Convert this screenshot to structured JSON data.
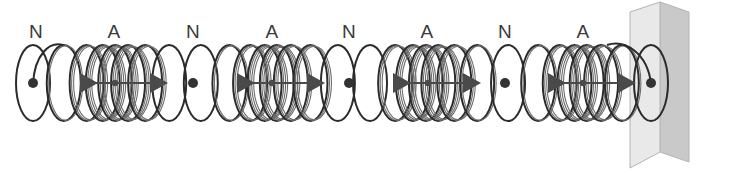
{
  "figure": {
    "background_color": "#ffffff",
    "width": 742,
    "height": 179,
    "axis_y": 83
  },
  "labels": [
    {
      "text": "N",
      "x": 36,
      "y": 38,
      "kind": "node"
    },
    {
      "text": "A",
      "x": 114,
      "y": 38,
      "kind": "antinode"
    },
    {
      "text": "N",
      "x": 193,
      "y": 38,
      "kind": "node"
    },
    {
      "text": "A",
      "x": 272,
      "y": 38,
      "kind": "antinode"
    },
    {
      "text": "N",
      "x": 349,
      "y": 38,
      "kind": "node"
    },
    {
      "text": "A",
      "x": 427,
      "y": 38,
      "kind": "antinode"
    },
    {
      "text": "N",
      "x": 505,
      "y": 38,
      "kind": "node"
    },
    {
      "text": "A",
      "x": 583,
      "y": 38,
      "kind": "antinode"
    }
  ],
  "spring": {
    "stroke_color": "#2b2b2b",
    "stroke_width": 2.0,
    "coil_count": 30,
    "start_x": 33,
    "end_x": 651,
    "coil_rx": 17,
    "coil_ry": 38,
    "bundle_color": "#6d6d6d"
  },
  "nodes": {
    "dot_color": "#333333",
    "dot_radius": 5,
    "positions": [
      33,
      193,
      349,
      505,
      651
    ]
  },
  "antinodes": {
    "arrow_color": "#4a4a4a",
    "centers": [
      115,
      272,
      428,
      583
    ],
    "half_length": 37,
    "head_length": 20,
    "head_width": 13
  },
  "wall": {
    "front_fill": "#e9e9e9",
    "side_fill": "#c9c9c9",
    "edge_color": "#b4b4b4",
    "front_points": "630,12 660,2 660,152 630,168",
    "side_points": "660,2 689,12 689,162 660,152",
    "label": "wall"
  },
  "chart_data": {
    "type": "line",
    "xlabel": "",
    "ylabel": "",
    "annotations": [
      "N",
      "A",
      "N",
      "A",
      "N",
      "A",
      "N",
      "A"
    ],
    "nodes_x": [
      33,
      193,
      349,
      505,
      651
    ],
    "antinodes_x": [
      115,
      272,
      428,
      583
    ],
    "harmonic_number": 4,
    "wavelength_px": 312
  }
}
